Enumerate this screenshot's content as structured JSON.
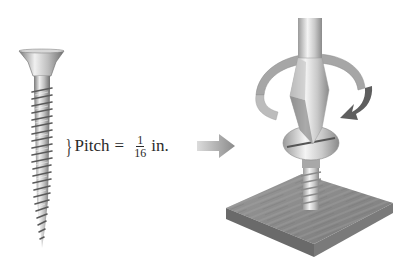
{
  "figure": {
    "pitch_label": {
      "prefix": "Pitch",
      "equals": "=",
      "fraction_numerator": "1",
      "fraction_denominator": "16",
      "unit": "in."
    },
    "brace_glyph": "}",
    "colors": {
      "metal_light": "#e6e6e6",
      "metal_dark": "#8a8a8a",
      "arrow": "#9a9a9a",
      "wood_top": "#8c8c8c",
      "wood_side": "#6a6a6a",
      "text": "#2a2a2a"
    },
    "elements": [
      "wood-screw",
      "pitch-annotation",
      "direction-arrow",
      "screwdriver",
      "rotation-arrow",
      "screw-in-wood",
      "wood-block"
    ]
  }
}
